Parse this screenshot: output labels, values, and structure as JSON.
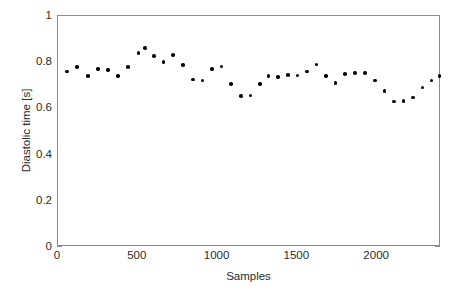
{
  "chart_data": {
    "type": "scatter",
    "title": "",
    "xlabel": "Samples",
    "ylabel": "Diastolic time [s]",
    "xlim": [
      0,
      2400
    ],
    "ylim": [
      0,
      1
    ],
    "xticks": [
      0,
      500,
      1000,
      1500,
      2000
    ],
    "xtick_labels": [
      "0",
      "500",
      "1000",
      "1500",
      "2000"
    ],
    "yticks": [
      0,
      0.2,
      0.4,
      0.6,
      0.8,
      1
    ],
    "ytick_labels": [
      "0",
      "0.2",
      "0.4",
      "0.6",
      "0.8",
      "1"
    ],
    "grid": false,
    "legend": null,
    "marker": {
      "shape": "circle",
      "filled": true,
      "color": "#000000",
      "size_px": 3.6
    },
    "axis_color": "#8c8c8c",
    "background": "#ffffff",
    "series": [
      {
        "name": "Diastolic time",
        "x": [
          57,
          120,
          188,
          250,
          312,
          375,
          440,
          505,
          570,
          625,
          690,
          750,
          815,
          875,
          940,
          1000,
          1065,
          1125,
          1190,
          1255,
          1320,
          1380,
          1440,
          1505,
          1570,
          1630,
          1690,
          1755,
          1815,
          1880,
          1940,
          2000,
          2065,
          2130,
          2190,
          2255,
          2320,
          2380
        ],
        "y": [
          0.76,
          0.78,
          0.74,
          0.77,
          0.77,
          0.74,
          0.78,
          0.84,
          0.86,
          0.83,
          0.8,
          0.83,
          0.79,
          0.725,
          0.72,
          0.77,
          0.78,
          0.705,
          0.655,
          0.657,
          0.705,
          0.74,
          0.737,
          0.745,
          0.742,
          0.76,
          0.79,
          0.74,
          0.71,
          0.748,
          0.753,
          0.752,
          0.72,
          0.675,
          0.63,
          0.632,
          0.648,
          0.69
        ],
        "points": [
          {
            "x": 57,
            "y": 0.76
          },
          {
            "x": 120,
            "y": 0.78
          },
          {
            "x": 188,
            "y": 0.74
          },
          {
            "x": 250,
            "y": 0.77
          },
          {
            "x": 312,
            "y": 0.767
          },
          {
            "x": 375,
            "y": 0.74
          },
          {
            "x": 440,
            "y": 0.778
          },
          {
            "x": 505,
            "y": 0.84
          },
          {
            "x": 545,
            "y": 0.862
          },
          {
            "x": 600,
            "y": 0.828
          },
          {
            "x": 660,
            "y": 0.8
          },
          {
            "x": 720,
            "y": 0.83
          },
          {
            "x": 785,
            "y": 0.788
          },
          {
            "x": 845,
            "y": 0.725
          },
          {
            "x": 905,
            "y": 0.72
          },
          {
            "x": 965,
            "y": 0.77
          },
          {
            "x": 1025,
            "y": 0.782
          },
          {
            "x": 1085,
            "y": 0.705
          },
          {
            "x": 1145,
            "y": 0.653
          },
          {
            "x": 1205,
            "y": 0.656
          },
          {
            "x": 1265,
            "y": 0.705
          },
          {
            "x": 1320,
            "y": 0.74
          },
          {
            "x": 1380,
            "y": 0.737
          },
          {
            "x": 1440,
            "y": 0.745
          },
          {
            "x": 1500,
            "y": 0.742
          },
          {
            "x": 1560,
            "y": 0.76
          },
          {
            "x": 1620,
            "y": 0.79
          },
          {
            "x": 1680,
            "y": 0.74
          },
          {
            "x": 1740,
            "y": 0.71
          },
          {
            "x": 1800,
            "y": 0.748
          },
          {
            "x": 1860,
            "y": 0.753
          },
          {
            "x": 1925,
            "y": 0.752
          },
          {
            "x": 1985,
            "y": 0.72
          },
          {
            "x": 2045,
            "y": 0.675
          },
          {
            "x": 2105,
            "y": 0.63
          },
          {
            "x": 2165,
            "y": 0.632
          },
          {
            "x": 2225,
            "y": 0.648
          },
          {
            "x": 2285,
            "y": 0.69
          },
          {
            "x": 2340,
            "y": 0.72
          },
          {
            "x": 2390,
            "y": 0.74
          }
        ]
      }
    ]
  }
}
